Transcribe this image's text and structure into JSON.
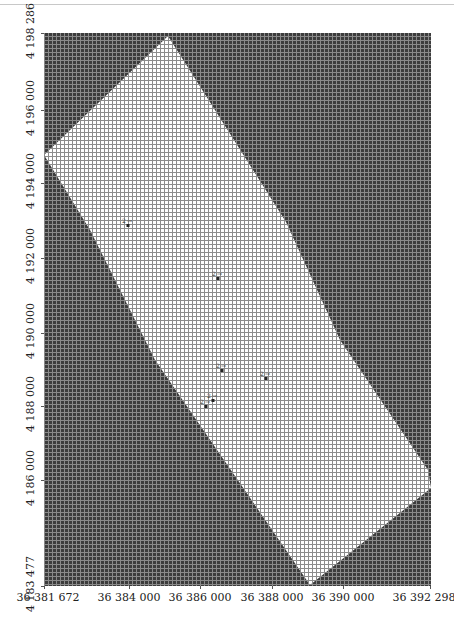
{
  "map": {
    "title": "",
    "region": {
      "outside_fill": "#3c3c3c",
      "outside_grid": "#8a8a8a",
      "inside_fill": "#ffffff",
      "inside_grid": "#8c8c8c",
      "polygon_px": [
        [
          168,
          36
        ],
        [
          286,
          222
        ],
        [
          340,
          340
        ],
        [
          428,
          470
        ],
        [
          431,
          488
        ],
        [
          310,
          585
        ],
        [
          155,
          360
        ],
        [
          90,
          230
        ],
        [
          44,
          155
        ]
      ]
    },
    "y_axis": {
      "ticks": [
        {
          "label": "4 198 286",
          "y": 33
        },
        {
          "label": "4 196 000",
          "y": 110
        },
        {
          "label": "4 194 000",
          "y": 183
        },
        {
          "label": "4 192 000",
          "y": 258
        },
        {
          "label": "4 190 000",
          "y": 333
        },
        {
          "label": "4 188 000",
          "y": 406
        },
        {
          "label": "4 186 000",
          "y": 480
        },
        {
          "label": "4 183 477",
          "y": 586
        }
      ]
    },
    "x_axis": {
      "ticks": [
        {
          "label": "36 381 672",
          "x": 44
        },
        {
          "label": "36 384 000",
          "x": 129
        },
        {
          "label": "36 386 000",
          "x": 200
        },
        {
          "label": "36 388 000",
          "x": 272
        },
        {
          "label": "36 390 000",
          "x": 343
        },
        {
          "label": "36 392 298",
          "x": 430
        }
      ]
    },
    "markers": [
      {
        "name": "point-cluster-1",
        "x": 128,
        "y": 225
      },
      {
        "name": "point-cluster-2",
        "x": 218,
        "y": 278
      },
      {
        "name": "point-cluster-3",
        "x": 222,
        "y": 370
      },
      {
        "name": "point-cluster-4",
        "x": 266,
        "y": 378
      },
      {
        "name": "point-cluster-5",
        "x": 213,
        "y": 400
      },
      {
        "name": "point-cluster-6",
        "x": 206,
        "y": 406
      }
    ]
  }
}
